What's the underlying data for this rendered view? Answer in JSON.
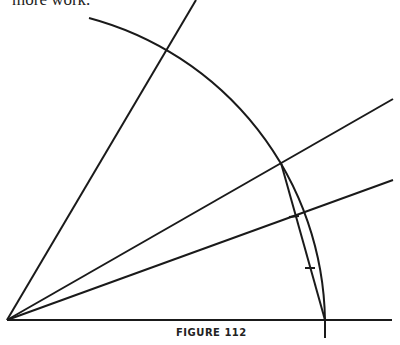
{
  "text": {
    "top_fragment": "more work."
  },
  "figure": {
    "caption": "FIGURE 112"
  },
  "colors": {
    "ink": "#1a1a1a"
  }
}
